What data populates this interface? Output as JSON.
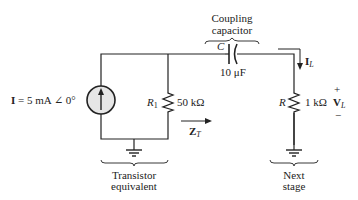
{
  "source": {
    "symbol": "I",
    "equals": "=",
    "value": "5 mA",
    "angle": "∠ 0°"
  },
  "r1": {
    "symbol": "R",
    "subscript": "1",
    "value": "50 kΩ"
  },
  "zt": {
    "symbol": "Z",
    "subscript": "T"
  },
  "capacitor": {
    "caption_line1": "Coupling",
    "caption_line2": "capacitor",
    "symbol": "C",
    "value": "10 μF"
  },
  "load": {
    "symbol": "R",
    "value": "1 kΩ",
    "current_symbol": "I",
    "current_subscript": "L",
    "voltage_symbol": "V",
    "voltage_subscript": "L",
    "plus": "+",
    "minus": "−"
  },
  "groups": {
    "left_line1": "Transistor",
    "left_line2": "equivalent",
    "right_line1": "Next",
    "right_line2": "stage"
  },
  "colors": {
    "wire": "#222222",
    "source_fill": "#e6e6e6",
    "text": "#222222"
  }
}
